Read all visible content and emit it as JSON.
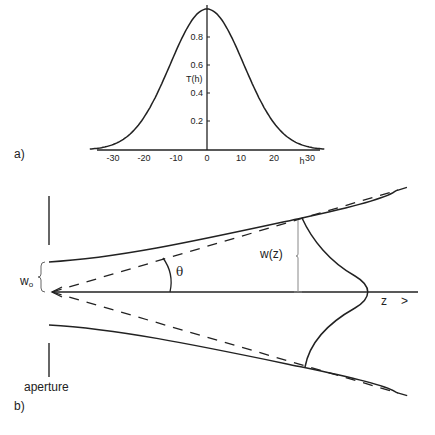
{
  "panel_a": {
    "label": "a)",
    "y_axis_label": "T(h)",
    "x_axis_label": "h",
    "x_ticks": [
      "-30",
      "-20",
      "-10",
      "0",
      "10",
      "20",
      "30"
    ],
    "y_ticks": [
      "0.2",
      "0.4",
      "0.6",
      "0.8"
    ]
  },
  "panel_b": {
    "label": "b)",
    "aperture_label": "aperture",
    "waist_label": "w",
    "waist_subscript": "o",
    "angle_label": "θ",
    "width_label": "w(z)",
    "axis_label": "z",
    "axis_arrow": ">"
  },
  "chart_data": {
    "type": "line",
    "title": "",
    "xlabel": "h",
    "ylabel": "T(h)",
    "xlim": [
      -35,
      35
    ],
    "ylim": [
      0,
      1.0
    ],
    "x_ticks": [
      -30,
      -20,
      -10,
      0,
      10,
      20,
      30
    ],
    "y_ticks": [
      0.2,
      0.4,
      0.6,
      0.8
    ],
    "grid": false,
    "series": [
      {
        "name": "T(h) Gaussian",
        "x": [
          -35,
          -30,
          -25,
          -20,
          -15,
          -10,
          -5,
          0,
          5,
          10,
          15,
          20,
          25,
          30,
          35
        ],
        "y": [
          0.0,
          0.01,
          0.04,
          0.12,
          0.29,
          0.55,
          0.86,
          1.0,
          0.86,
          0.55,
          0.29,
          0.12,
          0.04,
          0.01,
          0.0
        ]
      }
    ]
  }
}
